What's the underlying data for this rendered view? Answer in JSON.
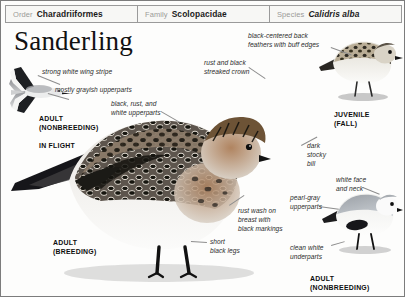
{
  "header": {
    "fields": [
      {
        "label": "Order",
        "value": "Charadriiformes",
        "italic": false
      },
      {
        "label": "Family",
        "value": "Scolopacidae",
        "italic": false
      },
      {
        "label": "Species",
        "value": "Calidris alba",
        "italic": true
      }
    ]
  },
  "title": "Sanderling",
  "callouts": {
    "wing_stripe": "strong white wing stripe",
    "grayish_upperparts": "mostly grayish upperparts",
    "black_rust_white": "black, rust, and\nwhite upperparts",
    "streaked_crown": "rust and black\nstreaked crown",
    "back_feathers": "black-centered back\nfeathers with buff edges",
    "stocky_bill": "dark\nstocky\nbill",
    "white_face": "white face\nand neck",
    "pearl_gray": "pearl-gray\nupperparts",
    "rust_wash": "rust wash on\nbreast with\nblack markings",
    "short_legs": "short\nblack legs",
    "clean_white": "clean white\nunderparts"
  },
  "plates": {
    "in_flight_age": "ADULT\n(NONBREEDING)",
    "in_flight": "IN FLIGHT",
    "juvenile": "JUVENILE\n(FALL)",
    "adult_breeding": "ADULT\n(BREEDING)",
    "adult_nonbreeding": "ADULT\n(NONBREEDING)"
  },
  "colors": {
    "page_border": "#7c7c7c",
    "header_bg": "#f7f7f5",
    "label_gray": "#9b9b98",
    "text_dark": "#1b1b1b",
    "leader_line": "#8d8d8d",
    "rust": "#9c6b42",
    "buff": "#c8ab80",
    "pearl_gray": "#b9bcc0",
    "black_markings": "#1a1a1a"
  }
}
